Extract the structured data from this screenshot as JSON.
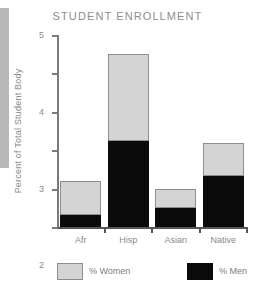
{
  "chart_data": {
    "type": "bar",
    "subtype": "stacked-vertical",
    "title": "STUDENT ENROLLMENT",
    "xlabel": "",
    "ylabel": "Percent of Total Student Body",
    "categories": [
      "Afr",
      "Hisp",
      "Asian",
      "Native"
    ],
    "series": [
      {
        "name": "% Men",
        "color": "#0b0b0b",
        "values": [
          0.3,
          2.25,
          0.5,
          1.33
        ]
      },
      {
        "name": "% Women",
        "color": "#d4d4d4",
        "values": [
          0.9,
          2.25,
          0.5,
          0.87
        ]
      }
    ],
    "totals": [
      1.2,
      4.5,
      1.0,
      2.2
    ],
    "ylim": [
      0,
      5
    ],
    "yticks": [
      0,
      1,
      2,
      3,
      4,
      5
    ],
    "ytick_labels": [
      "0",
      "1",
      "2",
      "3",
      "4",
      "5"
    ],
    "grid": false,
    "legend_position": "bottom",
    "stack_order": "men-bottom-women-top"
  },
  "legend": {
    "items": [
      {
        "label": "% Women",
        "swatch": "women"
      },
      {
        "label": "% Men",
        "swatch": "men"
      }
    ]
  },
  "artifacts": {
    "bottom_text": ""
  }
}
